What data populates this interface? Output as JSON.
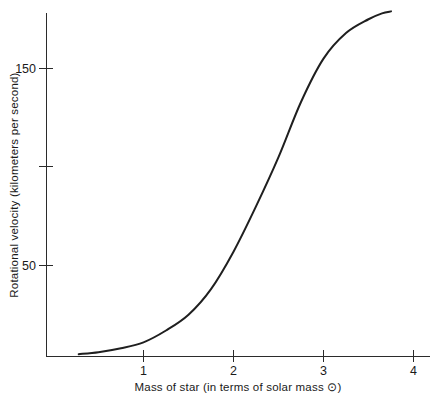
{
  "chart_data": {
    "type": "line",
    "title": "",
    "xlabel": "Mass of star (in terms of solar mass ⊙)",
    "ylabel": "Rotational velocity (kilometers per second)",
    "xlim": [
      0.2,
      4.5
    ],
    "ylim": [
      0,
      180
    ],
    "grid": false,
    "legend": null,
    "xticks": [
      {
        "value": 1,
        "label": "1"
      },
      {
        "value": 2,
        "label": "2"
      },
      {
        "value": 3,
        "label": "3"
      },
      {
        "value": 4,
        "label": "4"
      }
    ],
    "yticks": [
      {
        "value": 50,
        "label": "50"
      },
      {
        "value": 100,
        "label": ""
      },
      {
        "value": 150,
        "label": "150"
      }
    ],
    "series": [
      {
        "name": "Rotational velocity vs stellar mass",
        "color": "#1f1f1f",
        "x": [
          0.28,
          0.5,
          0.75,
          1.0,
          1.25,
          1.5,
          1.75,
          2.0,
          2.25,
          2.5,
          2.75,
          3.0,
          3.25,
          3.5,
          3.65,
          3.75
        ],
        "y": [
          5,
          6,
          8,
          11,
          17,
          25,
          38,
          57,
          80,
          105,
          133,
          155,
          168,
          175,
          178,
          179
        ]
      }
    ],
    "annotations": []
  },
  "axis_labels": {
    "x_title": "Mass of star (in terms of solar mass ⊙)",
    "y_title": "Rotational velocity (kilometers per second)",
    "x_tick_1": "1",
    "x_tick_2": "2",
    "x_tick_3": "3",
    "x_tick_4": "4",
    "y_tick_50": "50",
    "y_tick_150": "150"
  },
  "colors": {
    "background": "#ffffff",
    "axis": "#2b2b2b",
    "curve": "#1f1f1f",
    "text": "#1a1a1a"
  }
}
